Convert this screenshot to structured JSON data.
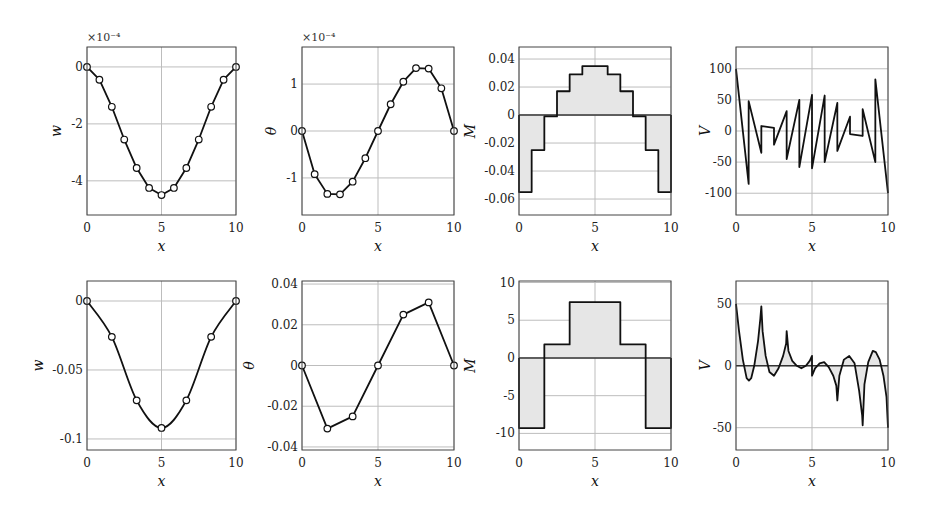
{
  "chart_data": [
    {
      "id": "top-w",
      "type": "line",
      "row": 0,
      "col": 0,
      "ylabel": "w",
      "xlabel": "x",
      "multiplier": "×10⁻⁴",
      "xlim": [
        0,
        10
      ],
      "ylim": [
        -5.2,
        0.7
      ],
      "xticks": [
        0,
        5,
        10
      ],
      "yticks": [
        0,
        -2,
        -4
      ],
      "ytick_labels": [
        "0",
        "-2",
        "-4"
      ],
      "grid": true,
      "markers": true,
      "fill": false,
      "x": [
        0,
        0.833,
        1.667,
        2.5,
        3.333,
        4.167,
        5,
        5.833,
        6.667,
        7.5,
        8.333,
        9.167,
        10
      ],
      "y": [
        0,
        -0.45,
        -1.4,
        -2.55,
        -3.55,
        -4.25,
        -4.5,
        -4.25,
        -3.55,
        -2.55,
        -1.4,
        -0.45,
        0
      ]
    },
    {
      "id": "top-theta",
      "type": "line",
      "row": 0,
      "col": 1,
      "ylabel": "θ",
      "xlabel": "x",
      "multiplier": "×10⁻⁴",
      "xlim": [
        0,
        10
      ],
      "ylim": [
        -1.79,
        1.79
      ],
      "xticks": [
        0,
        5,
        10
      ],
      "yticks": [
        1,
        0,
        -1
      ],
      "ytick_labels": [
        "1",
        "0",
        "-1"
      ],
      "grid": true,
      "markers": true,
      "fill": false,
      "x": [
        0,
        0.833,
        1.667,
        2.5,
        3.333,
        4.167,
        5,
        5.833,
        6.667,
        7.5,
        8.333,
        9.167,
        10
      ],
      "y": [
        0,
        -0.92,
        -1.34,
        -1.35,
        -1.08,
        -0.58,
        0,
        0.57,
        1.05,
        1.34,
        1.33,
        0.91,
        0
      ]
    },
    {
      "id": "top-M",
      "type": "area",
      "row": 0,
      "col": 2,
      "ylabel": "M",
      "xlabel": "x",
      "multiplier": "",
      "xlim": [
        0,
        10
      ],
      "ylim": [
        -0.0714,
        0.0486
      ],
      "xticks": [
        0,
        5,
        10
      ],
      "yticks": [
        0.04,
        0.02,
        0,
        -0.02,
        -0.04,
        -0.06
      ],
      "ytick_labels": [
        "0.04",
        "0.02",
        "0",
        "-0.02",
        "-0.04",
        "-0.06"
      ],
      "grid": true,
      "markers": false,
      "fill": true,
      "step": true,
      "x": [
        0,
        0.833,
        1.667,
        2.5,
        3.333,
        4.167,
        5,
        5.833,
        6.667,
        7.5,
        8.333,
        9.167,
        10
      ],
      "y": [
        -0.055,
        -0.025,
        -0.001,
        0.017,
        0.029,
        0.035,
        0.035,
        0.029,
        0.017,
        -0.001,
        -0.025,
        -0.055
      ]
    },
    {
      "id": "top-V",
      "type": "line",
      "row": 0,
      "col": 3,
      "ylabel": "V",
      "xlabel": "x",
      "multiplier": "",
      "xlim": [
        0,
        10
      ],
      "ylim": [
        -135,
        135
      ],
      "xticks": [
        0,
        5,
        10
      ],
      "yticks": [
        100,
        50,
        0,
        -50,
        -100
      ],
      "ytick_labels": [
        "100",
        "50",
        "0",
        "-50",
        "-100"
      ],
      "grid": true,
      "markers": false,
      "fill": false,
      "x": [
        0,
        0.833,
        0.833,
        1.667,
        1.667,
        2.5,
        2.5,
        3.333,
        3.333,
        4.167,
        4.167,
        5,
        5,
        5.833,
        5.833,
        6.667,
        6.667,
        7.5,
        7.5,
        8.333,
        8.333,
        9.167,
        9.167,
        10
      ],
      "y": [
        100,
        -85,
        48,
        -35,
        8,
        5,
        -22,
        32,
        -45,
        50,
        -58,
        58,
        -60,
        57,
        -50,
        45,
        -32,
        23,
        -5,
        -8,
        35,
        -50,
        83,
        -100
      ]
    },
    {
      "id": "bottom-w",
      "type": "line",
      "row": 1,
      "col": 0,
      "ylabel": "w",
      "xlabel": "x",
      "multiplier": "",
      "xlim": [
        0,
        10
      ],
      "ylim": [
        -0.108,
        0.0145
      ],
      "xticks": [
        0,
        5,
        10
      ],
      "yticks": [
        0,
        -0.05,
        -0.1
      ],
      "ytick_labels": [
        "0",
        "-0.05",
        "-0.1"
      ],
      "grid": true,
      "markers": true,
      "fill": false,
      "smooth": true,
      "x": [
        0,
        1.667,
        3.333,
        5,
        6.667,
        8.333,
        10
      ],
      "y": [
        0,
        -0.026,
        -0.072,
        -0.092,
        -0.072,
        -0.026,
        0
      ]
    },
    {
      "id": "bottom-theta",
      "type": "line",
      "row": 1,
      "col": 1,
      "ylabel": "θ",
      "xlabel": "x",
      "multiplier": "",
      "xlim": [
        0,
        10
      ],
      "ylim": [
        -0.0415,
        0.0415
      ],
      "xticks": [
        0,
        5,
        10
      ],
      "yticks": [
        0.04,
        0.02,
        0,
        -0.02,
        -0.04
      ],
      "ytick_labels": [
        "0.04",
        "0.02",
        "0",
        "-0.02",
        "-0.04"
      ],
      "grid": true,
      "markers": true,
      "fill": false,
      "x": [
        0,
        1.667,
        3.333,
        5,
        6.667,
        8.333,
        10
      ],
      "y": [
        0,
        -0.031,
        -0.025,
        0,
        0.025,
        0.031,
        0
      ]
    },
    {
      "id": "bottom-M",
      "type": "area",
      "row": 1,
      "col": 2,
      "ylabel": "M",
      "xlabel": "x",
      "multiplier": "",
      "xlim": [
        0,
        10
      ],
      "ylim": [
        -12.2,
        10.2
      ],
      "xticks": [
        0,
        5,
        10
      ],
      "yticks": [
        10,
        5,
        0,
        -5,
        -10
      ],
      "ytick_labels": [
        "10",
        "5",
        "0",
        "-5",
        "-10"
      ],
      "grid": true,
      "markers": false,
      "fill": true,
      "step": true,
      "x": [
        0,
        1.667,
        3.333,
        5,
        6.667,
        8.333,
        10
      ],
      "y": [
        -9.3,
        1.8,
        7.4,
        7.4,
        1.8,
        -9.3
      ]
    },
    {
      "id": "bottom-V",
      "type": "area",
      "row": 1,
      "col": 3,
      "ylabel": "V",
      "xlabel": "x",
      "multiplier": "",
      "xlim": [
        0,
        10
      ],
      "ylim": [
        -68,
        68.5
      ],
      "xticks": [
        0,
        5,
        10
      ],
      "yticks": [
        50,
        0,
        -50
      ],
      "ytick_labels": [
        "50",
        "0",
        "-50"
      ],
      "grid": true,
      "markers": false,
      "fill": true,
      "x": [
        0,
        0.2,
        0.45,
        0.7,
        0.85,
        1.0,
        1.2,
        1.45,
        1.6,
        1.667,
        1.75,
        1.95,
        2.2,
        2.5,
        2.8,
        3.1,
        3.3,
        3.333,
        3.45,
        3.7,
        4.0,
        4.3,
        4.6,
        4.85,
        5.0,
        5.0,
        5.2,
        5.5,
        5.8,
        6.1,
        6.4,
        6.6,
        6.667,
        6.8,
        7.1,
        7.45,
        7.8,
        8.1,
        8.3,
        8.333,
        8.45,
        8.7,
        9.0,
        9.2,
        9.45,
        9.7,
        9.9,
        10
      ],
      "y": [
        50,
        28,
        5,
        -10,
        -12,
        -10,
        0,
        20,
        38,
        48,
        28,
        8,
        -5,
        -8,
        -2,
        8,
        18,
        28,
        12,
        4,
        0,
        -2,
        0,
        4,
        8,
        -8,
        -2,
        2,
        3,
        -1,
        -8,
        -16,
        -28,
        -8,
        5,
        8,
        2,
        -20,
        -40,
        -48,
        -15,
        3,
        12,
        11,
        5,
        -8,
        -25,
        -50
      ]
    }
  ],
  "layout": {
    "columns": [
      {
        "left": 87,
        "right": 236
      },
      {
        "left": 302,
        "right": 454
      },
      {
        "left": 519,
        "right": 671
      },
      {
        "left": 736,
        "right": 888
      }
    ],
    "rows": [
      {
        "top": 47,
        "bottom": 215
      },
      {
        "top": 281,
        "bottom": 450
      }
    ]
  }
}
